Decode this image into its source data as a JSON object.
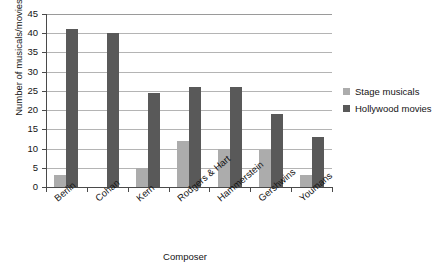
{
  "chart_data": {
    "type": "bar",
    "title": "",
    "xlabel": "Composer",
    "ylabel": "Number of musicals/movies",
    "categories": [
      "Berlin",
      "Cohan",
      "Kern",
      "Rodgers & Hart",
      "Hammerstein",
      "Gershwins",
      "Youmans"
    ],
    "series": [
      {
        "name": "Stage musicals",
        "color": "#acacac",
        "values": [
          3,
          0,
          5,
          12,
          10,
          9.5,
          3
        ]
      },
      {
        "name": "Hollywood movies",
        "color": "#595959",
        "values": [
          41,
          40,
          24.5,
          26,
          26,
          19,
          13
        ]
      }
    ],
    "ylim": [
      0,
      45
    ],
    "yticks": [
      0,
      5,
      10,
      15,
      20,
      25,
      30,
      35,
      40,
      45
    ],
    "ytick_labels": [
      "0",
      "5",
      "10",
      "15",
      "20",
      "25",
      "30",
      "35",
      "40",
      "45"
    ],
    "grid": true,
    "grid_axis": "y",
    "legend_position": "right",
    "xtick_rotation": -40,
    "background": "#ffffff",
    "axis_color": "#4a4a4a",
    "grid_color": "#b4b4b4"
  }
}
